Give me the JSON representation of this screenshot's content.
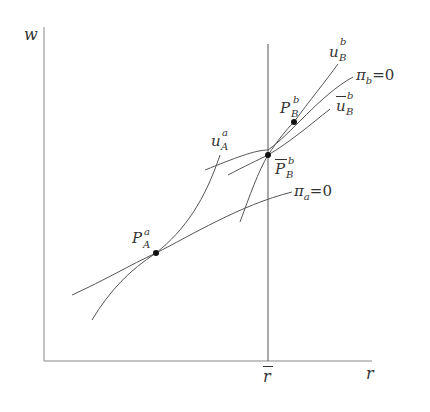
{
  "figure": {
    "axes": {
      "y_label": "w",
      "x_label": "r",
      "x_marker_label": "r",
      "x_marker_overbar": true
    },
    "curves": [
      {
        "id": "u_A_a",
        "base": "u",
        "sub": "A",
        "sup": "a",
        "overbar": false
      },
      {
        "id": "pi_a",
        "base": "π",
        "sub": "a",
        "suffix": "=0"
      },
      {
        "id": "u_B_b",
        "base": "u",
        "sub": "B",
        "sup": "b",
        "overbar": false
      },
      {
        "id": "pi_b",
        "base": "π",
        "sub": "b",
        "suffix": "=0"
      },
      {
        "id": "u_B_b_bar",
        "base": "u",
        "sub": "B",
        "sup": "b",
        "overbar": true
      }
    ],
    "points": [
      {
        "id": "P_A_a",
        "base": "P",
        "sub": "A",
        "sup": "a",
        "overbar": false
      },
      {
        "id": "P_B_b",
        "base": "P",
        "sub": "B",
        "sup": "b",
        "overbar": false
      },
      {
        "id": "P_B_b_bar",
        "base": "P",
        "sub": "B",
        "sup": "b",
        "overbar": true
      }
    ],
    "colors": {
      "line": "#555555",
      "dot": "#111111",
      "text": "#333333"
    }
  }
}
